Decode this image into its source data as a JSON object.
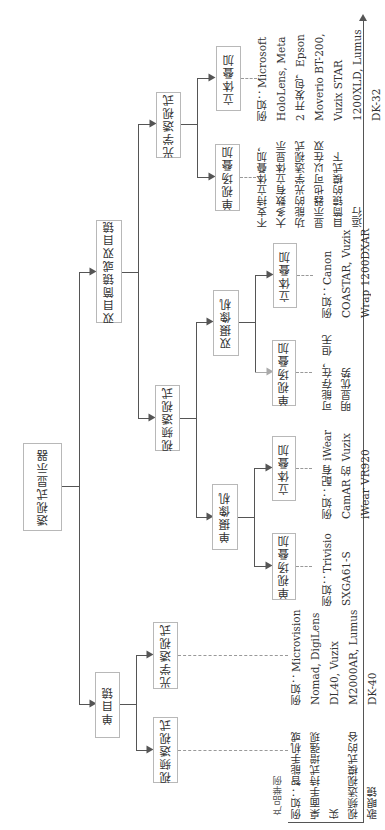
{
  "diagram": {
    "root": "透视式显示器",
    "level1": {
      "binocular": "双目筒镜或双目镜",
      "monocular": "单目镜"
    },
    "binocular_children": {
      "video": "视频透视式",
      "optical": "光学透视式"
    },
    "video_children": {
      "single_camera": "单摄像机",
      "dual_camera": "双摄像机"
    },
    "single_camera_children": {
      "mono": "单视场叠加",
      "stereo": "立体叠加"
    },
    "dual_camera_children": {
      "mono": "单视场叠加",
      "stereo": "立体叠加"
    },
    "optical_children": {
      "mono": "单视场叠加",
      "stereo": "立体叠加"
    },
    "monocular_children": {
      "video": "视频透视式",
      "optical": "光学透视式"
    },
    "axis_label": "产品举例",
    "examples": {
      "mono_video": [
        "例如：智能手机或",
        "桌面手持式增强现",
        "实",
        "视频透视模式的谷",
        "歌眼镜"
      ],
      "mono_optical": [
        "例如：Microvision",
        "Nomad, DigiLens",
        "DL40, Vuzix",
        "M2000AR, Lumus",
        "DK-40"
      ],
      "single_cam_mono": [
        "例如：Trivisio",
        "SXGA61-S"
      ],
      "single_cam_stereo": [
        "例如：配有 iWear",
        "CamAR 的 Vuzix",
        "iWear VR920"
      ],
      "dual_cam_mono": [
        "可能存在，但无",
        "明显优势"
      ],
      "dual_cam_stereo": [
        "例如：Canon",
        "COASTAR, Vuzix",
        "Wrap 1200DXAR"
      ],
      "optical_mono": [
        "不支持立体叠加，",
        "大多数有立体显示",
        "功能的光学透视式",
        "显示器也可以在双",
        "目筒镜的模式下",
        "运行"
      ],
      "optical_stereo": [
        "例如：Microsoft",
        "HoloLens, Meta",
        "2 开发包，Epson",
        "Moverio BT-200,",
        "Vuzix STAR",
        "1200XLD, Lumus",
        "DK-32"
      ]
    }
  }
}
